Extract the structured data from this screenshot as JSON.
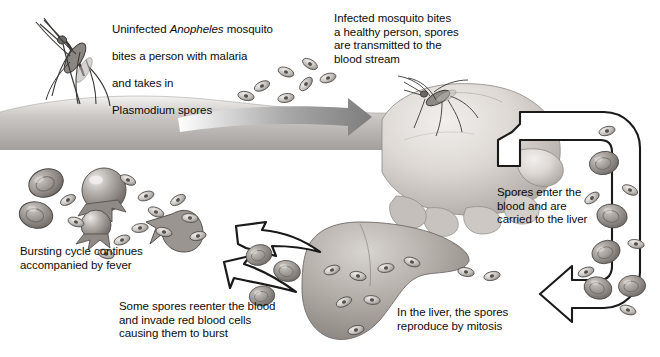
{
  "diagram": {
    "background": "#ffffff",
    "ink": "#111111",
    "style": "grayscale halftone textbook illustration"
  },
  "captions": [
    {
      "id": "mosquito-bite-infected-person",
      "text_lines": [
        "Uninfected Anopheles mosquito",
        "bites a person with malaria",
        "and takes in",
        "Plasmodium spores"
      ],
      "line1_prefix": "Uninfected ",
      "line1_italic": "Anopheles",
      "line1_suffix": " mosquito",
      "line2": "bites a person with malaria",
      "line3": "and takes in",
      "line4": "Plasmodium spores",
      "x": 112,
      "y": 9
    },
    {
      "id": "mosquito-bites-healthy-person",
      "text": "Infected mosquito bites\na healthy person, spores\nare transmitted to the\nblood stream",
      "x": 334,
      "y": 12
    },
    {
      "id": "spores-enter-blood",
      "text": "Spores enter the\nblood and are\ncarried to the liver",
      "x": 497,
      "y": 186
    },
    {
      "id": "bursting-cycle-fever",
      "text": "Bursting cycle continues\naccompanied by fever",
      "x": 20,
      "y": 245
    },
    {
      "id": "spores-reenter-blood",
      "text": "Some spores reenter the blood\nand invade red blood cells\ncausing them to burst",
      "x": 119,
      "y": 300
    },
    {
      "id": "liver-mitosis",
      "text": "In the liver, the spores\nreproduce by mitosis",
      "x": 397,
      "y": 306
    }
  ],
  "illustrations": [
    {
      "id": "mosquito-on-skin",
      "label": "Anopheles mosquito feeding on skin"
    },
    {
      "id": "skin-surface",
      "label": "shaded skin surface band"
    },
    {
      "id": "spore-cluster-skin",
      "label": "cluster of Plasmodium spores above skin",
      "count": 7
    },
    {
      "id": "transmission-arrow",
      "label": "large gradient arrow pointing right"
    },
    {
      "id": "hand-fist",
      "label": "clenched fist of a healthy person"
    },
    {
      "id": "mosquito-on-hand",
      "label": "infected mosquito biting the hand"
    },
    {
      "id": "blood-vessel-arrow",
      "label": "outlined vessel arrow carrying blood to the liver"
    },
    {
      "id": "red-blood-cells-vessel",
      "label": "red blood cells inside vessel",
      "count": 6
    },
    {
      "id": "liver",
      "label": "liver containing spores reproducing by mitosis"
    },
    {
      "id": "liver-spores",
      "label": "spores inside liver",
      "count": 8
    },
    {
      "id": "reenter-arrow",
      "label": "outlined arrow of spores reentering the blood"
    },
    {
      "id": "infected-rbc-pair",
      "label": "two infected red blood cells"
    },
    {
      "id": "bursting-cells",
      "label": "bursting red blood cells releasing spores"
    },
    {
      "id": "released-spores",
      "label": "spores released from burst cells",
      "count": 12
    }
  ]
}
